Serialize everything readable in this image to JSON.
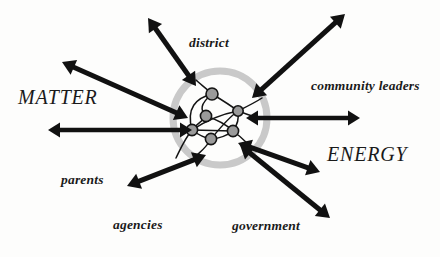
{
  "figure": {
    "background_color": "#fdfdfc",
    "ink_color": "#111111",
    "boundary_color": "#c9c9c9"
  },
  "boundary": {
    "name": "system boundary ring",
    "center_x": 220,
    "center_y": 118,
    "radius": 47,
    "stroke_width": 7,
    "color": "#c9c9c9"
  },
  "flow_labels": [
    {
      "id": "matter",
      "text": "MATTER",
      "x": 18,
      "y": 87
    },
    {
      "id": "energy",
      "text": "ENERGY",
      "x": 327,
      "y": 144
    }
  ],
  "entity_labels": [
    {
      "id": "district",
      "text": "district",
      "x": 189,
      "y": 36
    },
    {
      "id": "community_leaders",
      "text": "community leaders",
      "x": 311,
      "y": 79
    },
    {
      "id": "parents",
      "text": "parents",
      "x": 61,
      "y": 173
    },
    {
      "id": "agencies",
      "text": "agencies",
      "x": 113,
      "y": 218
    },
    {
      "id": "government",
      "text": "government",
      "x": 232,
      "y": 219
    }
  ],
  "arrows": [
    {
      "id": "arrow-upper-left",
      "label": "upper left diagonal exchange",
      "x1": 188,
      "y1": 118,
      "x2": 62,
      "y2": 62,
      "width": 5.0,
      "head": 13,
      "double": true
    },
    {
      "id": "arrow-district",
      "label": "district exchange",
      "x1": 196,
      "y1": 86,
      "x2": 148,
      "y2": 18,
      "width": 5.0,
      "head": 13,
      "double": true
    },
    {
      "id": "arrow-upper-right",
      "label": "upper right diagonal exchange",
      "x1": 252,
      "y1": 98,
      "x2": 345,
      "y2": 14,
      "width": 5.0,
      "head": 13,
      "double": true
    },
    {
      "id": "arrow-left",
      "label": "left horizontal exchange",
      "x1": 192,
      "y1": 130,
      "x2": 48,
      "y2": 130,
      "width": 4.6,
      "head": 12,
      "double": true
    },
    {
      "id": "arrow-right",
      "label": "community leaders exchange",
      "x1": 246,
      "y1": 118,
      "x2": 360,
      "y2": 118,
      "width": 4.6,
      "head": 12,
      "double": true
    },
    {
      "id": "arrow-lower-left",
      "label": "parents and agencies exchange",
      "x1": 206,
      "y1": 155,
      "x2": 127,
      "y2": 186,
      "width": 5.0,
      "head": 13,
      "double": true
    },
    {
      "id": "arrow-lower-right",
      "label": "energy outflow exchange",
      "x1": 238,
      "y1": 143,
      "x2": 320,
      "y2": 172,
      "width": 5.0,
      "head": 13,
      "double": true
    },
    {
      "id": "arrow-government",
      "label": "government exchange",
      "x1": 240,
      "y1": 145,
      "x2": 330,
      "y2": 218,
      "width": 5.0,
      "head": 13,
      "double": true
    }
  ],
  "nodes": [
    {
      "id": "node-1",
      "cx": 212,
      "cy": 94,
      "r": 6.0
    },
    {
      "id": "node-2",
      "cx": 238,
      "cy": 111,
      "r": 5.2
    },
    {
      "id": "node-3",
      "cx": 206,
      "cy": 116,
      "r": 5.6
    },
    {
      "id": "node-4",
      "cx": 192,
      "cy": 130,
      "r": 5.6
    },
    {
      "id": "node-5",
      "cx": 233,
      "cy": 131,
      "r": 5.6
    },
    {
      "id": "node-6",
      "cx": 211,
      "cy": 139,
      "r": 5.6
    }
  ],
  "edges": [
    {
      "id": "edge-1",
      "path": "M 212 94 C 222 100 230 105 238 111"
    },
    {
      "id": "edge-2",
      "path": "M 212 94 C 196 98 186 108 192 130"
    },
    {
      "id": "edge-3",
      "path": "M 212 94 C 200 104 200 110 206 116"
    },
    {
      "id": "edge-4",
      "path": "M 206 116 C 200 124 194 126 192 130"
    },
    {
      "id": "edge-5",
      "path": "M 192 130 L 233 131"
    },
    {
      "id": "edge-6",
      "path": "M 192 130 C 200 136 205 138 211 139"
    },
    {
      "id": "edge-7",
      "path": "M 211 139 C 222 138 228 135 233 131"
    },
    {
      "id": "edge-8",
      "path": "M 233 131 C 238 124 239 117 238 111"
    },
    {
      "id": "edge-9",
      "path": "M 206 116 C 218 120 228 126 233 131"
    },
    {
      "id": "edge-10",
      "path": "M 238 111 C 228 118 220 128 211 139"
    },
    {
      "id": "edge-11",
      "path": "M 192 130 C 204 122 222 114 238 111"
    },
    {
      "id": "edge-12",
      "path": "M 211 139 C 206 148 200 152 196 156"
    },
    {
      "id": "edge-13",
      "path": "M 192 130 C 184 140 180 150 176 158"
    },
    {
      "id": "edge-14",
      "path": "M 238 111 C 248 106 256 102 262 98"
    },
    {
      "id": "edge-15",
      "path": "M 233 131 C 240 136 244 140 248 144"
    },
    {
      "id": "edge-16",
      "path": "M 212 94 C 206 88 200 84 196 80"
    },
    {
      "id": "edge-17",
      "path": "M 238 111 C 246 114 252 116 258 118"
    }
  ]
}
